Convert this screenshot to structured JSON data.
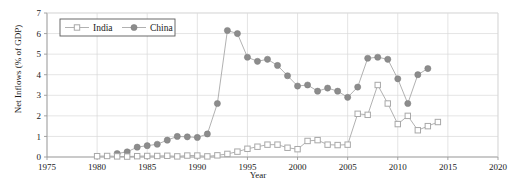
{
  "chart_data": {
    "type": "line",
    "title": "",
    "xlabel": "Year",
    "ylabel": "Net Inflows (% of GDP)",
    "xlim": [
      1975,
      2020
    ],
    "ylim": [
      0,
      7
    ],
    "xticks": [
      1975,
      1980,
      1985,
      1990,
      1995,
      2000,
      2005,
      2010,
      2015,
      2020
    ],
    "yticks": [
      0,
      1,
      2,
      3,
      4,
      5,
      6,
      7
    ],
    "xtick_labels": [
      "1975",
      "1980",
      "1985",
      "1990",
      "1995",
      "2000",
      "2005",
      "2010",
      "2015",
      "2020"
    ],
    "ytick_labels": [
      "0",
      "1",
      "2",
      "3",
      "4",
      "5",
      "6",
      "7"
    ],
    "grid": true,
    "grid_color": "#d9d9d9",
    "legend_position": "top-left-inside",
    "background": "#ffffff",
    "axis_color": "#9a9a9a",
    "series": [
      {
        "name": "India",
        "marker": "open-square",
        "color": "#a8a8a8",
        "line_color": "#a8a8a8",
        "x": [
          1980,
          1981,
          1982,
          1983,
          1984,
          1985,
          1986,
          1987,
          1988,
          1989,
          1990,
          1991,
          1992,
          1993,
          1994,
          1995,
          1996,
          1997,
          1998,
          1999,
          2000,
          2001,
          2002,
          2003,
          2004,
          2005,
          2006,
          2007,
          2008,
          2009,
          2010,
          2011,
          2012,
          2013,
          2014
        ],
        "values": [
          0.04,
          0.05,
          0.03,
          0.02,
          0.04,
          0.05,
          0.05,
          0.06,
          0.03,
          0.07,
          0.07,
          0.03,
          0.08,
          0.15,
          0.26,
          0.4,
          0.5,
          0.6,
          0.6,
          0.45,
          0.38,
          0.78,
          0.82,
          0.6,
          0.58,
          0.6,
          2.1,
          2.05,
          3.5,
          2.6,
          1.6,
          2.0,
          1.3,
          1.5,
          1.7
        ]
      },
      {
        "name": "China",
        "marker": "filled-circle",
        "color": "#8c8c8c",
        "line_color": "#a8a8a8",
        "x": [
          1982,
          1983,
          1984,
          1985,
          1986,
          1987,
          1988,
          1989,
          1990,
          1991,
          1992,
          1993,
          1994,
          1995,
          1996,
          1997,
          1998,
          1999,
          2000,
          2001,
          2002,
          2003,
          2004,
          2005,
          2006,
          2007,
          2008,
          2009,
          2010,
          2011,
          2012,
          2013
        ],
        "values": [
          0.17,
          0.25,
          0.48,
          0.55,
          0.62,
          0.82,
          1.0,
          0.98,
          0.95,
          1.12,
          2.6,
          6.15,
          6.0,
          4.85,
          4.65,
          4.75,
          4.45,
          3.95,
          3.45,
          3.5,
          3.2,
          3.35,
          3.2,
          2.9,
          3.4,
          4.8,
          4.85,
          4.75,
          3.8,
          2.6,
          4.0,
          4.3
        ]
      }
    ]
  },
  "legend": {
    "india_label": "India",
    "china_label": "China"
  },
  "axes": {
    "x_title": "Year",
    "y_title": "Net Inflows (% of GDP)"
  }
}
